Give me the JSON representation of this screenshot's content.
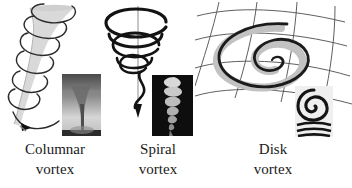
{
  "figure": {
    "background_color": "#ffffff",
    "width": 352,
    "height": 188
  },
  "colors": {
    "ink": "#1a1a1a",
    "line_dark": "#111111",
    "line_gray": "#555555",
    "funnel_fill": "#d9d9d9",
    "shadow_gray": "#c4c4c4",
    "photo_dark": "#151515",
    "photo_light": "#e8e8e8",
    "background": "#ffffff"
  },
  "panels": [
    {
      "id": "columnar",
      "caption_line1": "Columnar",
      "caption_line2": "vortex",
      "diagram": "funnel-with-helix",
      "photo": "tornado-funnel-photo"
    },
    {
      "id": "spiral",
      "caption_line1": "Spiral",
      "caption_line2": "vortex",
      "diagram": "conical-spiral-with-axis-arrow",
      "photo": "helical-vortex-photo"
    },
    {
      "id": "disk",
      "caption_line1": "Disk",
      "caption_line2": "vortex",
      "diagram": "flat-spiral-on-curved-grid",
      "photo": "spiral-disk-photo"
    }
  ]
}
